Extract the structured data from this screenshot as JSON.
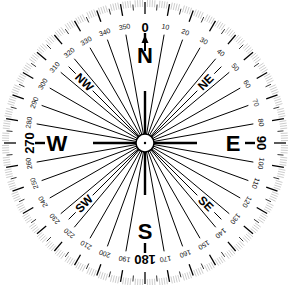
{
  "diagram": {
    "type": "compass-rose",
    "center": {
      "x": 145,
      "y": 143
    },
    "outer_radius": 143,
    "colors": {
      "ink": "#000000",
      "fine_tick": "#999999",
      "background": "#ffffff"
    },
    "cardinals": [
      {
        "letter": "N",
        "degree": "0",
        "angle": 0
      },
      {
        "letter": "E",
        "degree": "90",
        "angle": 90
      },
      {
        "letter": "S",
        "degree": "180",
        "angle": 180
      },
      {
        "letter": "W",
        "degree": "270",
        "angle": 270
      }
    ],
    "intercardinals": [
      {
        "label": "NE",
        "angle": 45
      },
      {
        "label": "SE",
        "angle": 135
      },
      {
        "label": "SW",
        "angle": 225
      },
      {
        "label": "NW",
        "angle": 315
      }
    ],
    "degree_labels": [
      "10",
      "20",
      "30",
      "40",
      "50",
      "60",
      "70",
      "80",
      "100",
      "110",
      "120",
      "130",
      "140",
      "150",
      "160",
      "170",
      "190",
      "200",
      "210",
      "220",
      "230",
      "240",
      "250",
      "260",
      "280",
      "290",
      "300",
      "310",
      "320",
      "330",
      "340",
      "350"
    ],
    "north_arrow": "↑"
  }
}
